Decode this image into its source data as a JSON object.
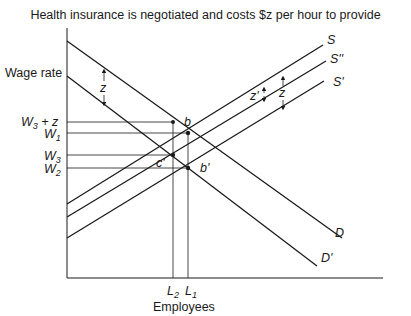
{
  "title": "Health insurance is negotiated and costs $z per hour to provide",
  "axes": {
    "y_label": "Wage rate",
    "x_label": "Employees"
  },
  "wage_ticks": [
    {
      "label": "W3 + z",
      "main": "W",
      "sub": "3",
      "suffix": " + z",
      "y": 122
    },
    {
      "label": "W1",
      "main": "W",
      "sub": "1",
      "suffix": "",
      "y": 133
    },
    {
      "label": "W3",
      "main": "W",
      "sub": "3",
      "suffix": "",
      "y": 155
    },
    {
      "label": "W2",
      "main": "W",
      "sub": "2",
      "suffix": "",
      "y": 168
    }
  ],
  "employment_ticks": [
    {
      "label": "L2",
      "main": "L",
      "sub": "2",
      "x": 173
    },
    {
      "label": "L1",
      "main": "L",
      "sub": "1",
      "x": 188
    }
  ],
  "curves": {
    "S": "S",
    "S_double_prime": "S''",
    "S_prime": "S'",
    "D": "D",
    "D_prime": "D'"
  },
  "points": {
    "b": "b",
    "b_prime": "b'",
    "c_prime": "c'"
  },
  "shift_labels": {
    "demand_shift": "z",
    "supply_shift_full": "z",
    "supply_shift_partial": "z'"
  },
  "colors": {
    "line": "#1a1a1a",
    "background": "#ffffff"
  }
}
